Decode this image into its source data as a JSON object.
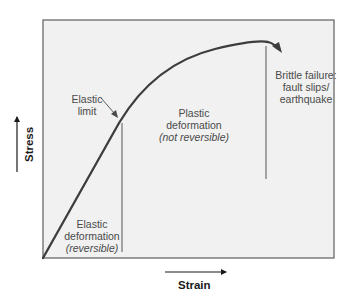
{
  "diagram": {
    "colors": {
      "plot_background": "#f1f1f1",
      "frame": "#6b6b6b",
      "curve": "#3d3d3d",
      "label_text": "#4a4a4a",
      "axis_title_text": "#1a1a1a"
    },
    "axes": {
      "y_label": "Stress",
      "x_label": "Strain"
    },
    "regions": {
      "elastic_limit": {
        "line1": "Elastic",
        "line2": "limit"
      },
      "elastic_deformation": {
        "line1": "Elastic",
        "line2": "deformation",
        "note": "(reversible)"
      },
      "plastic_deformation": {
        "line1": "Plastic",
        "line2": "deformation",
        "note": "(not reversible)"
      },
      "brittle_failure": {
        "line1": "Brittle failure:",
        "line2": "fault slips/",
        "line3": "earthquake"
      }
    }
  }
}
